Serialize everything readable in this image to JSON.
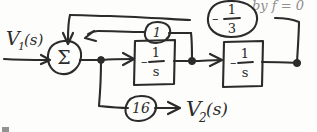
{
  "diagram": {
    "kind": "hand-drawn-block-diagram",
    "ink_color": "#2b2b2b",
    "paper_color": "#fdfdfc",
    "input": {
      "label_main": "V",
      "label_sub": "1",
      "label_paren": "(s)"
    },
    "output": {
      "label_main": "V",
      "label_sub": "2",
      "label_paren": "(s)"
    },
    "summing_junction": {
      "symbol": "Σ",
      "name": "sigma"
    },
    "blocks": [
      {
        "id": "block-1",
        "minus": "–",
        "numerator": "1",
        "denominator": "s",
        "text": "-1/s"
      },
      {
        "id": "block-2",
        "minus": "–",
        "numerator": "1",
        "denominator": "s",
        "text": "-1/s"
      }
    ],
    "gains": [
      {
        "id": "gain-unity",
        "value": "1",
        "shape": "oval"
      },
      {
        "id": "gain-neg-third",
        "minus": "–",
        "numerator": "1",
        "denominator": "3",
        "value": "-1/3",
        "shape": "circle"
      },
      {
        "id": "gain-sixteen",
        "value": "16",
        "shape": "oval"
      }
    ],
    "edge_text": {
      "top_right_cutoff": "by f = 0"
    }
  }
}
